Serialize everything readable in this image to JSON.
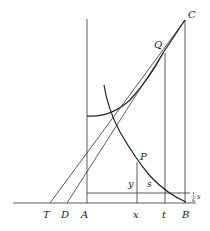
{
  "diagram": {
    "labels": {
      "C": "C",
      "Q": "Q",
      "P": "P",
      "y": "y",
      "s": "s",
      "T": "T",
      "D": "D",
      "A": "A",
      "x": "x",
      "t": "t",
      "B": "B",
      "frac_num": "1",
      "frac_den": "6",
      "frac_var": "s"
    }
  }
}
